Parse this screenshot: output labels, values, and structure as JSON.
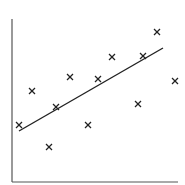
{
  "chart_data": {
    "type": "scatter",
    "title": "",
    "xlabel": "",
    "ylabel": "",
    "grid": false,
    "legend": null,
    "marker": "x",
    "points_px": [
      [
        19,
        125
      ],
      [
        32,
        91
      ],
      [
        49,
        147
      ],
      [
        56,
        107
      ],
      [
        70,
        77
      ],
      [
        88,
        125
      ],
      [
        98,
        79
      ],
      [
        112,
        57
      ],
      [
        138,
        104
      ],
      [
        143,
        56
      ],
      [
        157,
        32
      ],
      [
        175,
        81
      ]
    ],
    "trend_line_px": [
      [
        19,
        131
      ],
      [
        163,
        48
      ]
    ],
    "axes_px": {
      "origin": [
        12,
        182
      ],
      "y_top": 19,
      "x_right": 178
    },
    "colors": {
      "axis": "#555555",
      "marker": "#222222",
      "line": "#222222"
    }
  }
}
